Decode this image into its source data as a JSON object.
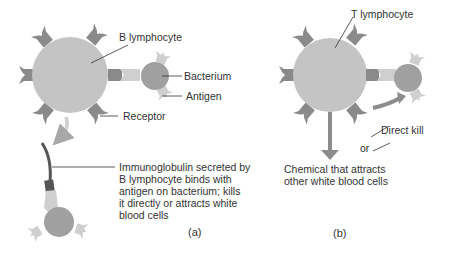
{
  "colors": {
    "cell": "#c4c4c4",
    "receptor": "#8a8a8a",
    "bacterium": "#a0a0a0",
    "antigen": "#cfcfcf",
    "arrow": "#a8a8a8",
    "arrow_dark": "#8c8c8c",
    "immunoglobulin": "#555555",
    "text": "#333333",
    "leader": "#333333"
  },
  "panel_a": {
    "cell_label": "B lymphocyte",
    "bacterium_label": "Bacterium",
    "antigen_label": "Antigen",
    "receptor_label": "Receptor",
    "description_lines": [
      "Immunoglobulin secreted by",
      "B lymphocyte binds with",
      "antigen on bacterium; kills",
      "it directly or attracts white",
      "blood cells"
    ],
    "caption": "(a)"
  },
  "panel_b": {
    "cell_label": "T lymphocyte",
    "direct_kill_label": "Direct kill",
    "or_label": "or",
    "chemical_lines": [
      "Chemical that attracts",
      "other white blood cells"
    ],
    "caption": "(b)"
  }
}
